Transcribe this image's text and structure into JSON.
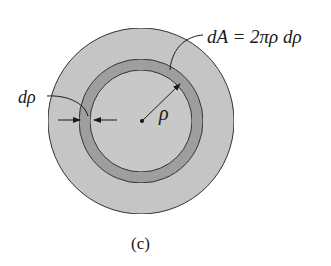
{
  "figure": {
    "caption": "(c)",
    "labels": {
      "area_element": "dA = 2πρ dρ",
      "thickness": "dρ",
      "radius": "ρ"
    },
    "colors": {
      "outer_disk": "#c6c6c6",
      "ring": "#9c9c9c",
      "inner_disk": "#c9c9c9",
      "stroke": "#222222",
      "background": "#ffffff"
    }
  }
}
